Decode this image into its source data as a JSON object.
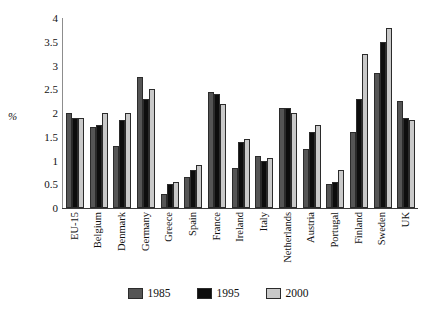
{
  "chart_data": {
    "type": "bar",
    "title": "",
    "xlabel": "",
    "ylabel": "%",
    "ylim": [
      0,
      4
    ],
    "ytick_step": 0.5,
    "yticks": [
      "4",
      "3.5",
      "3",
      "2.5",
      "2",
      "1.5",
      "1",
      "0.5",
      "0"
    ],
    "grid": false,
    "legend_position": "bottom",
    "categories": [
      "EU-15",
      "Belgium",
      "Denmark",
      "Germany",
      "Greece",
      "Spain",
      "France",
      "Ireland",
      "Italy",
      "Netherlands",
      "Austria",
      "Portugal",
      "Finland",
      "Sweden",
      "UK"
    ],
    "series": [
      {
        "name": "1985",
        "color": "#555555",
        "values": [
          2.0,
          1.7,
          1.3,
          2.75,
          0.3,
          0.65,
          2.45,
          0.85,
          1.1,
          2.1,
          1.25,
          0.5,
          1.6,
          2.85,
          2.25
        ]
      },
      {
        "name": "1995",
        "color": "#0d0d0d",
        "values": [
          1.9,
          1.75,
          1.85,
          2.3,
          0.5,
          0.8,
          2.4,
          1.4,
          1.0,
          2.1,
          1.6,
          0.55,
          2.3,
          3.5,
          1.9
        ]
      },
      {
        "name": "2000",
        "color": "#c9c9c9",
        "values": [
          1.9,
          2.0,
          2.0,
          2.5,
          0.55,
          0.9,
          2.2,
          1.45,
          1.05,
          2.0,
          1.75,
          0.8,
          3.25,
          3.8,
          1.85
        ]
      }
    ]
  }
}
